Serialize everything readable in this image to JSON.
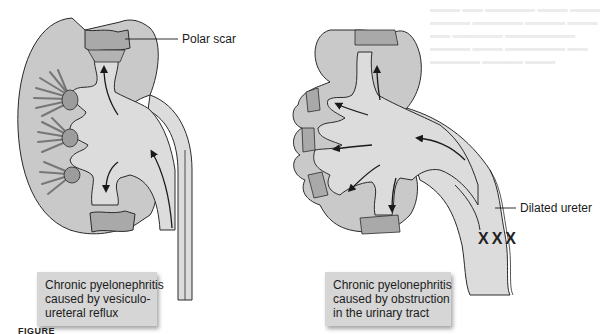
{
  "figure": {
    "caption_prefix": "FIGURE"
  },
  "left_panel": {
    "title_box": {
      "lines": [
        "Chronic pyelonephritis",
        "caused by vesiculo-",
        "ureteral reflux"
      ]
    },
    "labels": {
      "polar_scar": "Polar scar"
    }
  },
  "right_panel": {
    "title_box": {
      "lines": [
        "Chronic pyelonephritis",
        "caused by obstruction",
        "in the urinary tract"
      ]
    },
    "labels": {
      "dilated_ureter": "Dilated ureter",
      "obstruction_mark": "XXX"
    }
  },
  "colors": {
    "parenchyma": "#c9c9c9",
    "pelvis": "#dcdcdc",
    "scar": "#a9a9a9",
    "papilla": "#9c9c9c",
    "outline": "#2a2a2a",
    "caption_box": "#d6d6d6"
  }
}
